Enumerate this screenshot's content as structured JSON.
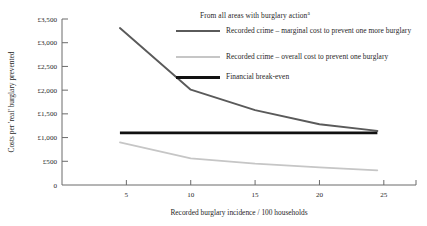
{
  "chart_data": {
    "type": "line",
    "title": "",
    "xlabel": "Recorded burglary incidence / 100 households",
    "ylabel": "Costs per 'real' burglary prevented",
    "xlim": [
      0,
      27.5
    ],
    "ylim": [
      0,
      3500
    ],
    "xticks": [
      5,
      10,
      15,
      20,
      25
    ],
    "xtick_labels": [
      "5",
      "10",
      "15",
      "20",
      "25"
    ],
    "yticks": [
      0,
      500,
      1000,
      1500,
      2000,
      2500,
      3000,
      3500
    ],
    "ytick_labels": [
      "0",
      "£500",
      "£1,000",
      "£1,500",
      "£2,000",
      "£2,500",
      "£3,000",
      "£3,500"
    ],
    "grid": false,
    "legend_position": "upper right",
    "legend_title": "From all areas with burglary action",
    "legend_title_superscript": "a",
    "series": [
      {
        "name": "Recorded crime – marginal cost to prevent one more burglary",
        "color": "#5a5a5a",
        "x": [
          4.5,
          10.0,
          15.0,
          20.0,
          24.5
        ],
        "values": [
          3310,
          2010,
          1580,
          1280,
          1140
        ]
      },
      {
        "name": "Recorded crime – overall cost to prevent one burglary",
        "color": "#c6c6c6",
        "x": [
          4.5,
          10.0,
          15.0,
          20.0,
          24.5
        ],
        "values": [
          900,
          560,
          450,
          370,
          310
        ]
      },
      {
        "name": "Financial break-even",
        "color": "#111111",
        "x": [
          4.5,
          24.5
        ],
        "values": [
          1100,
          1100
        ]
      }
    ]
  },
  "legend": {
    "title": "From all areas with burglary action",
    "title_superscript": "a",
    "items": [
      {
        "label": "Recorded crime – marginal cost to prevent one more burglary"
      },
      {
        "label": "Recorded crime – overall cost to prevent one burglary"
      },
      {
        "label": "Financial break-even"
      }
    ]
  },
  "axes": {
    "x_title": "Recorded burglary incidence / 100 households",
    "y_title": "Costs per 'real' burglary prevented"
  },
  "colors": {
    "marginal": "#5a5a5a",
    "overall": "#c6c6c6",
    "breakeven": "#111111",
    "axis": "#6b6b6b",
    "text": "#1f1f1f",
    "background": "#ffffff"
  }
}
